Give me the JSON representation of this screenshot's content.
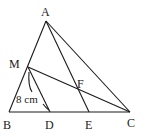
{
  "diagram": {
    "type": "geometry-triangle",
    "stroke_color": "#1a1a1a",
    "points": {
      "A": {
        "label": "A",
        "x": 46,
        "y": 21
      },
      "B": {
        "label": "B",
        "x": 9,
        "y": 112
      },
      "C": {
        "label": "C",
        "x": 130,
        "y": 112
      },
      "D": {
        "label": "D",
        "x": 50,
        "y": 112
      },
      "E": {
        "label": "E",
        "x": 89,
        "y": 112
      },
      "M": {
        "label": "M",
        "x": 28,
        "y": 67
      },
      "F": {
        "label": "F",
        "x": 79,
        "y": 89
      }
    },
    "segments": [
      "AB",
      "AC",
      "BC",
      "AE",
      "MC",
      "MD"
    ],
    "measurement": {
      "segment": "MD",
      "text": "8 cm"
    }
  }
}
